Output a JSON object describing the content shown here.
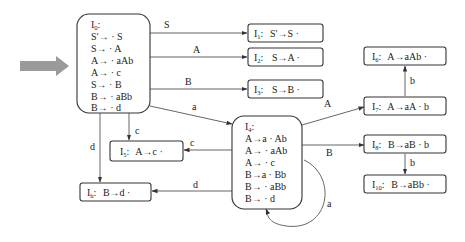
{
  "start_arrow": {
    "color": "#999999",
    "target": "I0"
  },
  "states": {
    "I0": {
      "name": "I",
      "sub": "0",
      "items": [
        "S′→ · S",
        "S→ · A",
        "A→ · aAb",
        "A→ · c",
        "S→ · B",
        "B→ · aBb",
        "B→ · d"
      ]
    },
    "I1": {
      "name": "I",
      "sub": "1",
      "item": "S′→S ·"
    },
    "I2": {
      "name": "I",
      "sub": "2",
      "item": "S→A ·"
    },
    "I3": {
      "name": "I",
      "sub": "3",
      "item": "S→B ·"
    },
    "I4": {
      "name": "I",
      "sub": "4",
      "items": [
        "A→a · Ab",
        "A→ · aAb",
        "A→ · c",
        "B→a · Bb",
        "B→ · aBb",
        "B→ · d"
      ]
    },
    "I5": {
      "name": "I",
      "sub": "5",
      "item": "A→c ·"
    },
    "I6": {
      "name": "I",
      "sub": "6",
      "item": "A→aAb ·"
    },
    "I7": {
      "name": "I",
      "sub": "7",
      "item": "A→aA · b"
    },
    "I8": {
      "name": "I",
      "sub": "8",
      "item": "B→aB · b"
    },
    "I9": {
      "name": "I",
      "sub": "h",
      "item": "B→d ·"
    },
    "I10": {
      "name": "I",
      "sub": "10",
      "item": "B→aBb ·"
    }
  },
  "edges": [
    {
      "from": "I0",
      "to": "I1",
      "label": "S"
    },
    {
      "from": "I0",
      "to": "I2",
      "label": "A"
    },
    {
      "from": "I0",
      "to": "I3",
      "label": "B"
    },
    {
      "from": "I0",
      "to": "I4",
      "label": "a"
    },
    {
      "from": "I0",
      "to": "I5",
      "label": "c"
    },
    {
      "from": "I0",
      "to": "I9",
      "label": "d"
    },
    {
      "from": "I4",
      "to": "I7",
      "label": "A"
    },
    {
      "from": "I4",
      "to": "I8",
      "label": "B"
    },
    {
      "from": "I4",
      "to": "I5",
      "label": "c"
    },
    {
      "from": "I4",
      "to": "I9",
      "label": "d"
    },
    {
      "from": "I4",
      "to": "I4",
      "label": "a"
    },
    {
      "from": "I7",
      "to": "I6",
      "label": "b"
    },
    {
      "from": "I8",
      "to": "I10",
      "label": "b"
    }
  ]
}
